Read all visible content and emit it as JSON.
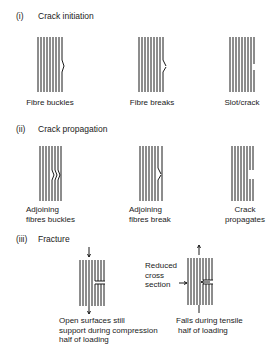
{
  "sections": [
    {
      "number": "(i)",
      "title": "Crack initiation",
      "items": [
        {
          "label": "Fibre buckles"
        },
        {
          "label": "Fibre breaks"
        },
        {
          "label": "Slot/crack"
        }
      ]
    },
    {
      "number": "(ii)",
      "title": "Crack propagation",
      "items": [
        {
          "label_line1": "Adjoining",
          "label_line2": "fibres buckles"
        },
        {
          "label_line1": "Adjoining",
          "label_line2": "fibres break"
        },
        {
          "label_line1": "Crack",
          "label_line2": "propagates"
        }
      ]
    },
    {
      "number": "(iii)",
      "title": "Fracture",
      "items": [
        {
          "label_line1": "Open surfaces still",
          "label_line2": "support during compression",
          "label_line3": "half of loading"
        },
        {
          "annotation_line1": "Reduced",
          "annotation_line2": "cross",
          "annotation_line3": "section",
          "label_line1": "Falls during tensile",
          "label_line2": "half of loading"
        }
      ]
    }
  ],
  "colors": {
    "ink": "#1a1a1a",
    "background": "#ffffff"
  }
}
